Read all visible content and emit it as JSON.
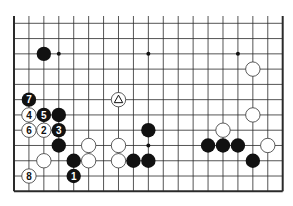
{
  "diagram": {
    "type": "go-board-diagram",
    "board_size": 19,
    "visible_rows": [
      7,
      18
    ],
    "visible_cols": [
      0,
      18
    ],
    "colors": {
      "line": "#2a2a2a",
      "black_stone": "#111111",
      "white_stone": "#ffffff",
      "background": "#ffffff"
    },
    "star_points": [
      [
        3,
        9
      ],
      [
        9,
        9
      ],
      [
        15,
        9
      ],
      [
        3,
        15
      ],
      [
        9,
        15
      ],
      [
        15,
        15
      ]
    ],
    "stones": [
      {
        "color": "black",
        "col": 2,
        "row": 9,
        "label": ""
      },
      {
        "color": "black",
        "col": 3,
        "row": 13,
        "label": ""
      },
      {
        "color": "black",
        "col": 3,
        "row": 15,
        "label": ""
      },
      {
        "color": "black",
        "col": 4,
        "row": 16,
        "label": ""
      },
      {
        "color": "black",
        "col": 9,
        "row": 14,
        "label": ""
      },
      {
        "color": "black",
        "col": 8,
        "row": 16,
        "label": ""
      },
      {
        "color": "black",
        "col": 9,
        "row": 16,
        "label": ""
      },
      {
        "color": "black",
        "col": 13,
        "row": 15,
        "label": ""
      },
      {
        "color": "black",
        "col": 14,
        "row": 15,
        "label": ""
      },
      {
        "color": "black",
        "col": 15,
        "row": 15,
        "label": ""
      },
      {
        "color": "black",
        "col": 16,
        "row": 16,
        "label": ""
      },
      {
        "color": "black",
        "col": 4,
        "row": 17,
        "label": "1"
      },
      {
        "color": "black",
        "col": 3,
        "row": 14,
        "label": "3"
      },
      {
        "color": "black",
        "col": 2,
        "row": 13,
        "label": "5"
      },
      {
        "color": "black",
        "col": 1,
        "row": 12,
        "label": "7"
      },
      {
        "color": "white",
        "col": 16,
        "row": 10,
        "label": ""
      },
      {
        "color": "white",
        "col": 16,
        "row": 13,
        "label": ""
      },
      {
        "color": "white",
        "col": 14,
        "row": 14,
        "label": ""
      },
      {
        "color": "white",
        "col": 17,
        "row": 15,
        "label": ""
      },
      {
        "color": "white",
        "col": 5,
        "row": 15,
        "label": ""
      },
      {
        "color": "white",
        "col": 7,
        "row": 15,
        "label": ""
      },
      {
        "color": "white",
        "col": 2,
        "row": 16,
        "label": ""
      },
      {
        "color": "white",
        "col": 5,
        "row": 16,
        "label": ""
      },
      {
        "color": "white",
        "col": 7,
        "row": 16,
        "label": ""
      },
      {
        "color": "white",
        "col": 2,
        "row": 14,
        "label": "2"
      },
      {
        "color": "white",
        "col": 1,
        "row": 13,
        "label": "4"
      },
      {
        "color": "white",
        "col": 1,
        "row": 14,
        "label": "6"
      },
      {
        "color": "white",
        "col": 1,
        "row": 17,
        "label": "8"
      },
      {
        "color": "white",
        "col": 7,
        "row": 12,
        "label": "",
        "marker": "triangle"
      }
    ]
  }
}
